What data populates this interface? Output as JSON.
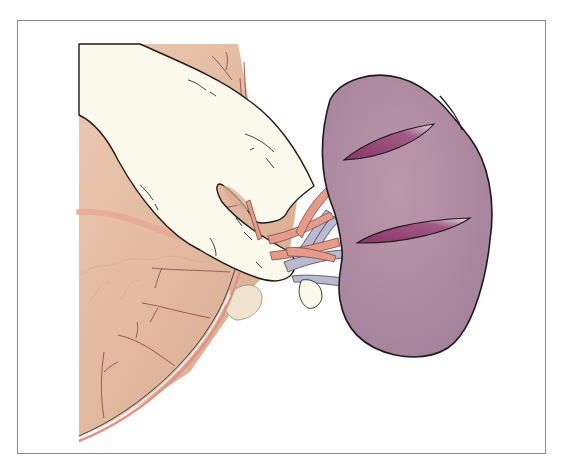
{
  "figure": {
    "kind": "surgical illustration",
    "colors": {
      "frame": "#8a8a8a",
      "background": "#fefefe",
      "tissue": "#e6c0a6",
      "tissue_shade": "#d8ab90",
      "glove": "#fbf8ec",
      "spleen": "#b48fa3",
      "spleen_shade": "#a4829a",
      "incision": "#8e3d6e",
      "artery": "#e69a8a",
      "vein": "#b9b9d2",
      "outline": "#1e1a1c",
      "vessel_line": "#9a5a5a"
    },
    "elements": [
      {
        "name": "spleen",
        "incisions": 2
      },
      {
        "name": "gloved-hand"
      },
      {
        "name": "splenic-hilum-vessels"
      },
      {
        "name": "abdominal-tissue"
      },
      {
        "name": "wound-edge"
      }
    ]
  }
}
